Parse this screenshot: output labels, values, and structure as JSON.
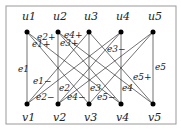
{
  "top_nodes": [
    {
      "label": "u1",
      "x": 27
    },
    {
      "label": "u2",
      "x": 58
    },
    {
      "label": "u3",
      "x": 89
    },
    {
      "label": "u4",
      "x": 121
    },
    {
      "label": "u5",
      "x": 153
    }
  ],
  "bottom_nodes": [
    {
      "label": "v1",
      "x": 27
    },
    {
      "label": "v2",
      "x": 58
    },
    {
      "label": "v3",
      "x": 89
    },
    {
      "label": "v4",
      "x": 121
    },
    {
      "label": "v5",
      "x": 153
    }
  ],
  "edge_labels": [
    "e1",
    "e2",
    "e3",
    "e4",
    "e5",
    "e1+",
    "e2+",
    "e3+",
    "e4+",
    "e5+",
    "e1−",
    "e2−",
    "e3−",
    "e4−",
    "e5−"
  ]
}
